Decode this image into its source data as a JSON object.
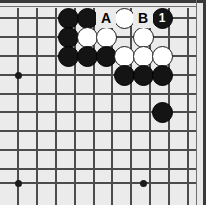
{
  "diagram": {
    "kind": "go-board-diagram",
    "title": "",
    "board": {
      "width_px": 206,
      "height_px": 205,
      "grid_spacing_px": 18.7,
      "background_color": "#ebebeb",
      "frame_color": "#3a3a3a",
      "line_color": "#4c4c4c",
      "origin": "top-right corner of a go board",
      "columns_x": [
        18,
        37,
        56,
        68,
        87,
        106,
        124,
        143,
        162,
        181
      ],
      "rows_y": [
        18,
        37,
        56,
        75,
        94,
        112,
        131,
        150,
        169,
        188
      ]
    },
    "star_points": [
      {
        "x": 18,
        "y": 75
      },
      {
        "x": 18,
        "y": 183
      },
      {
        "x": 143,
        "y": 183
      }
    ],
    "grid_vertical_x": [
      18,
      37,
      56,
      75,
      94,
      112,
      131,
      150,
      169,
      188
    ],
    "grid_horizontal_y": [
      18,
      37,
      56,
      75,
      94,
      112,
      131,
      150,
      169,
      183
    ],
    "stones": [
      {
        "color": "black",
        "x": 68,
        "y": 18,
        "label": ""
      },
      {
        "color": "black",
        "x": 87,
        "y": 18,
        "label": ""
      },
      {
        "color": "white",
        "x": 124,
        "y": 18,
        "label": ""
      },
      {
        "color": "black",
        "x": 162,
        "y": 18,
        "label": "1"
      },
      {
        "color": "black",
        "x": 68,
        "y": 37,
        "label": ""
      },
      {
        "color": "white",
        "x": 87,
        "y": 37,
        "label": ""
      },
      {
        "color": "white",
        "x": 106,
        "y": 37,
        "label": ""
      },
      {
        "color": "white",
        "x": 143,
        "y": 37,
        "label": ""
      },
      {
        "color": "black",
        "x": 68,
        "y": 56,
        "label": ""
      },
      {
        "color": "black",
        "x": 87,
        "y": 56,
        "label": ""
      },
      {
        "color": "black",
        "x": 106,
        "y": 56,
        "label": ""
      },
      {
        "color": "white",
        "x": 124,
        "y": 56,
        "label": ""
      },
      {
        "color": "white",
        "x": 143,
        "y": 56,
        "label": ""
      },
      {
        "color": "white",
        "x": 162,
        "y": 56,
        "label": ""
      },
      {
        "color": "black",
        "x": 124,
        "y": 75,
        "label": ""
      },
      {
        "color": "black",
        "x": 143,
        "y": 75,
        "label": ""
      },
      {
        "color": "black",
        "x": 162,
        "y": 75,
        "label": ""
      },
      {
        "color": "black",
        "x": 162,
        "y": 112,
        "label": ""
      }
    ],
    "point_labels": [
      {
        "text": "A",
        "x": 106,
        "y": 18
      },
      {
        "text": "B",
        "x": 143,
        "y": 18
      }
    ],
    "move_numbers": [
      {
        "number": "1",
        "color": "black",
        "x": 162,
        "y": 18
      }
    ]
  }
}
